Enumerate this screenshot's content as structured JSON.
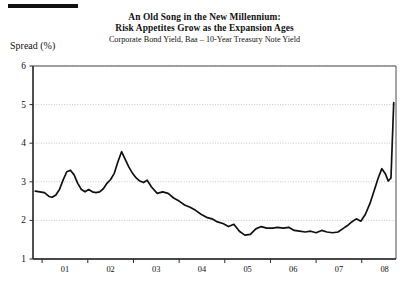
{
  "decorations": {
    "top_rule": "horizontal-rule"
  },
  "header": {
    "title_line1": "An Old Song in the New Millennium:",
    "title_line2": "Risk Appetites Grow as the Expansion Ages",
    "subtitle": "Corporate Bond Yield, Baa – 10-Year Treasury Note Yield"
  },
  "axis": {
    "y_label": "Spread (%)"
  },
  "chart_data": {
    "type": "line",
    "title": "An Old Song in the New Millennium: Risk Appetites Grow as the Expansion Ages",
    "subtitle": "Corporate Bond Yield, Baa – 10-Year Treasury Note Yield",
    "xlabel": "",
    "ylabel": "Spread (%)",
    "ylim": [
      1,
      6
    ],
    "xlim": [
      2000.8,
      2008.75
    ],
    "yticks": [
      1,
      2,
      3,
      4,
      5,
      6
    ],
    "ytick_labels": [
      "1",
      "2",
      "3",
      "4",
      "5",
      "6"
    ],
    "xticks": [
      2001,
      2002,
      2003,
      2004,
      2005,
      2006,
      2007,
      2008
    ],
    "xtick_labels": [
      "01",
      "02",
      "03",
      "04",
      "05",
      "06",
      "07",
      "08"
    ],
    "grid": true,
    "grid_axis": "y",
    "legend": false,
    "line_color": "#111111",
    "series": [
      {
        "name": "Corporate Bond Yield, Baa minus 10-Year Treasury Note Yield",
        "x": [
          2000.85,
          2000.95,
          2001.05,
          2001.15,
          2001.22,
          2001.3,
          2001.38,
          2001.46,
          2001.54,
          2001.62,
          2001.7,
          2001.78,
          2001.86,
          2001.94,
          2002.02,
          2002.1,
          2002.18,
          2002.26,
          2002.34,
          2002.42,
          2002.5,
          2002.58,
          2002.66,
          2002.74,
          2002.82,
          2002.9,
          2002.98,
          2003.06,
          2003.14,
          2003.22,
          2003.3,
          2003.4,
          2003.52,
          2003.64,
          2003.76,
          2003.88,
          2004.0,
          2004.12,
          2004.24,
          2004.36,
          2004.48,
          2004.6,
          2004.72,
          2004.84,
          2004.96,
          2005.08,
          2005.2,
          2005.32,
          2005.44,
          2005.56,
          2005.68,
          2005.8,
          2005.92,
          2006.04,
          2006.16,
          2006.28,
          2006.4,
          2006.52,
          2006.64,
          2006.76,
          2006.88,
          2007.0,
          2007.12,
          2007.24,
          2007.36,
          2007.48,
          2007.58,
          2007.68,
          2007.78,
          2007.88,
          2007.98,
          2008.08,
          2008.18,
          2008.28,
          2008.36,
          2008.44,
          2008.52,
          2008.58,
          2008.64,
          2008.7
        ],
        "y": [
          2.76,
          2.74,
          2.72,
          2.62,
          2.6,
          2.66,
          2.8,
          3.05,
          3.26,
          3.3,
          3.18,
          2.96,
          2.8,
          2.74,
          2.8,
          2.74,
          2.72,
          2.74,
          2.82,
          2.96,
          3.06,
          3.22,
          3.52,
          3.78,
          3.58,
          3.38,
          3.22,
          3.1,
          3.02,
          2.98,
          3.04,
          2.86,
          2.7,
          2.74,
          2.7,
          2.58,
          2.5,
          2.4,
          2.34,
          2.26,
          2.16,
          2.08,
          2.04,
          1.96,
          1.92,
          1.84,
          1.9,
          1.72,
          1.62,
          1.64,
          1.78,
          1.84,
          1.8,
          1.8,
          1.82,
          1.8,
          1.82,
          1.74,
          1.72,
          1.7,
          1.72,
          1.68,
          1.74,
          1.7,
          1.68,
          1.7,
          1.78,
          1.86,
          1.96,
          2.04,
          1.98,
          2.16,
          2.44,
          2.8,
          3.1,
          3.34,
          3.2,
          3.02,
          3.1,
          5.05
        ]
      }
    ],
    "annotations": []
  }
}
